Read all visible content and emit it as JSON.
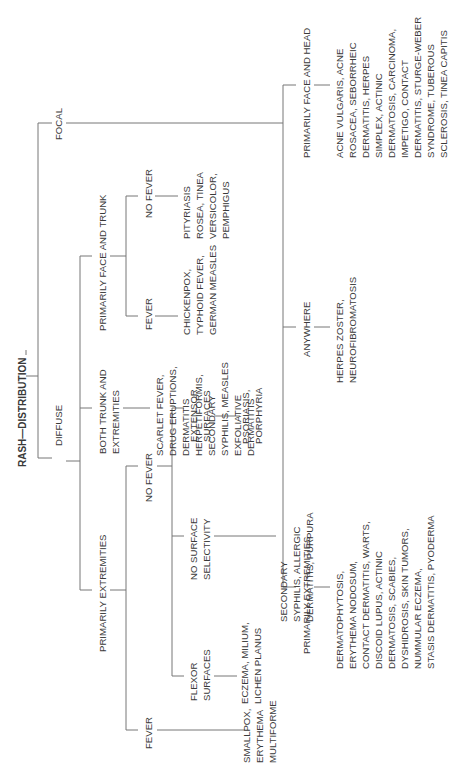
{
  "title": "RASH—DISTRIBUTION",
  "nodes": {
    "diffuse": "DIFFUSE",
    "focal": "FOCAL",
    "primarily_extremities": "PRIMARILY EXTREMITIES",
    "both_trunk": [
      "BOTH TRUNK AND",
      "EXTREMITIES"
    ],
    "primarily_face_trunk": "PRIMARILY FACE AND TRUNK",
    "pe_fever": "FEVER",
    "pe_no_fever": "NO FEVER",
    "flexor": [
      "FLEXOR",
      "SURFACES"
    ],
    "no_surface": [
      "NO SURFACE",
      "SELECTIVITY"
    ],
    "extensor": [
      "EXTENSOR",
      "SURFACES"
    ],
    "pft_fever": "FEVER",
    "pft_no_fever": "NO FEVER",
    "focal_extremities": "PRIMARILY EXTREMITIES",
    "focal_anywhere": "ANYWHERE",
    "focal_face_head": "PRIMARILY FACE AND HEAD"
  },
  "leaves": {
    "pe_fever": [
      "SMALLPOX,",
      "ERYTHEMA",
      "MULTIFORME"
    ],
    "flexor": [
      "ECZEMA, MILIUM,",
      "LICHEN PLANUS"
    ],
    "no_surface": [
      "SECONDARY",
      "SYPHILIS, ALLERGIC",
      "DERMATITIS, PURPURA"
    ],
    "extensor": [
      "PSORIASIS,",
      "PORPHYRIA"
    ],
    "both_trunk": [
      "SCARLET FEVER,",
      "DRUG ERUPTIONS,",
      "DERMATITIS",
      "HERPETIFORMIS,",
      "SECONDARY",
      "SYPHILIS, MEASLES",
      "EXFOLIATIVE",
      "DERMATITIS"
    ],
    "pft_fever": [
      "CHICKENPOX,",
      "TYPHOID FEVER,",
      "GERMAN MEASLES"
    ],
    "pft_no_fever": [
      "PITYRIASIS",
      "ROSEA, TINEA",
      "VERSICOLOR,",
      "PEMPHIGUS"
    ],
    "focal_extremities": [
      "DERMATOPHYTOSIS,",
      "ERYTHEMA NODOSUM,",
      "CONTACT DERMATITIS, WARTS,",
      "DISCOID LUPUS, ACTINIC",
      "DERMATOSIS, SCABIES,",
      "DYSHIDROSIS, SKIN TUMORS,",
      "NUMMULAR ECZEMA,",
      "STASIS DERMATITIS, PYODERMA"
    ],
    "focal_anywhere": [
      "HERPES ZOSTER,",
      "NEUROFIBROMATOSIS"
    ],
    "focal_face_head": [
      "ACNE VULGARIS, ACNE",
      "ROSACEA, SEBORRHEIC",
      "DERMATITIS, HERPES",
      "SIMPLEX, ACTINIC",
      "DERMATOSIS, CARCINOMA,",
      "IMPETIGO, CONTACT",
      "DERMATITIS, STURGE-WEBER",
      "SYNDROME, TUBEROUS",
      "SCLEROSIS, TINEA CAPITIS"
    ]
  }
}
